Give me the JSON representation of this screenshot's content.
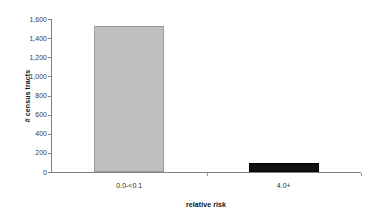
{
  "chart_data": {
    "type": "bar",
    "title": "",
    "subtitle": "",
    "categories": [
      "0.0-<0.1",
      "4.0+"
    ],
    "values": [
      1530,
      90
    ],
    "series": [
      {
        "name": "# census tracts",
        "values": [
          1530,
          90
        ],
        "colors": [
          "#bfbfbf",
          "#111111"
        ]
      }
    ],
    "xlabel": "relative risk",
    "ylabel": "# census tracts",
    "ylim": [
      0,
      1600
    ],
    "ytick_labels": [
      "0",
      "200",
      "400",
      "600",
      "800",
      "1,000",
      "1,200",
      "1,400",
      "1,600"
    ],
    "ytick_values": [
      0,
      200,
      400,
      600,
      800,
      1000,
      1200,
      1400,
      1600
    ],
    "grid": false,
    "legend": false,
    "legend_position": "none",
    "bar_colors": {
      "category_0": "#bfbfbf",
      "category_0_border": "#9c9c9c",
      "category_1": "#111111",
      "category_1_border": "#000000"
    },
    "axis_color": "#808080",
    "background": "#ffffff"
  }
}
